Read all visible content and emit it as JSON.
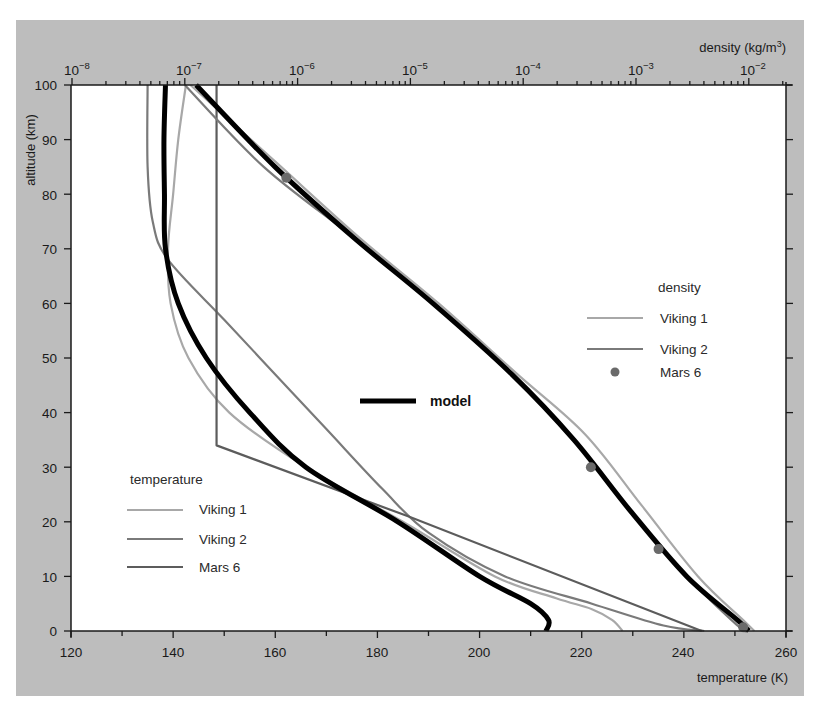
{
  "chart_data": {
    "type": "line",
    "title": "",
    "ylabel": "altitude (km)",
    "xlabel": "temperature (K)",
    "x2label": "density (kg/m3)",
    "ylim": [
      0,
      100
    ],
    "xlim": [
      120,
      260
    ],
    "x2lim_log10": [
      -8,
      -1.67
    ],
    "grid": false,
    "y_ticks": [
      "0",
      "10",
      "20",
      "30",
      "40",
      "50",
      "60",
      "70",
      "80",
      "90",
      "100"
    ],
    "x_ticks": [
      "120",
      "140",
      "160",
      "180",
      "200",
      "220",
      "240",
      "260"
    ],
    "x2_ticks": [
      "10⁻⁸",
      "10⁻⁷",
      "10⁻⁶",
      "10⁻⁵",
      "10⁻⁴",
      "10⁻³",
      "10⁻²"
    ],
    "series": [
      {
        "name": "model (temperature)",
        "group": "temperature",
        "style": "thick-black",
        "points": [
          [
            138.5,
            100
          ],
          [
            138.2,
            90
          ],
          [
            138.3,
            80
          ],
          [
            138.5,
            70
          ],
          [
            141,
            60
          ],
          [
            146.5,
            50
          ],
          [
            155,
            40
          ],
          [
            166,
            30
          ],
          [
            184,
            20
          ],
          [
            200,
            10
          ],
          [
            210,
            5
          ],
          [
            213.5,
            2
          ],
          [
            213,
            0
          ]
        ]
      },
      {
        "name": "Viking 1 (temperature)",
        "group": "temperature",
        "style": "light-gray",
        "points": [
          [
            142.5,
            100
          ],
          [
            141,
            90
          ],
          [
            140,
            80
          ],
          [
            139,
            70
          ],
          [
            139.5,
            60
          ],
          [
            143,
            50
          ],
          [
            151,
            40
          ],
          [
            166,
            30
          ],
          [
            185,
            20
          ],
          [
            203,
            10
          ],
          [
            215,
            6
          ],
          [
            222,
            4
          ],
          [
            226,
            2
          ],
          [
            228,
            0
          ]
        ]
      },
      {
        "name": "Viking 2 (temperature)",
        "group": "temperature",
        "style": "medium-gray",
        "points": [
          [
            135,
            100
          ],
          [
            135,
            85
          ],
          [
            136,
            75
          ],
          [
            139,
            68
          ],
          [
            150,
            57
          ],
          [
            160,
            47
          ],
          [
            170,
            37
          ],
          [
            181,
            26
          ],
          [
            190,
            18
          ],
          [
            205,
            10
          ],
          [
            222,
            5
          ],
          [
            236,
            1
          ],
          [
            244,
            0
          ]
        ]
      },
      {
        "name": "Mars 6 (temperature)",
        "group": "temperature",
        "style": "dark-gray",
        "points": [
          [
            148.5,
            100
          ],
          [
            148.5,
            34
          ],
          [
            186,
            21
          ],
          [
            243.5,
            0
          ]
        ]
      }
    ],
    "density_series": [
      {
        "name": "model (density)",
        "style": "thick-black",
        "points_log10": [
          [
            -6.9,
            100
          ],
          [
            -6.2,
            85
          ],
          [
            -5.5,
            72
          ],
          [
            -4.8,
            60
          ],
          [
            -4.1,
            47
          ],
          [
            -3.55,
            35
          ],
          [
            -3.05,
            22
          ],
          [
            -2.55,
            10
          ],
          [
            -2.1,
            2
          ],
          [
            -2.0,
            0
          ]
        ]
      },
      {
        "name": "Viking 1 (density)",
        "style": "light-gray",
        "points_log10": [
          [
            -6.95,
            100
          ],
          [
            -6.2,
            86
          ],
          [
            -5.45,
            72
          ],
          [
            -4.75,
            60
          ],
          [
            -4.05,
            47
          ],
          [
            -3.45,
            36
          ],
          [
            -2.95,
            23
          ],
          [
            -2.45,
            10
          ],
          [
            -2.05,
            2
          ],
          [
            -1.95,
            0
          ]
        ]
      },
      {
        "name": "Viking 2 (density)",
        "style": "medium-gray",
        "points_log10": [
          [
            -7.0,
            100
          ],
          [
            -6.3,
            85
          ],
          [
            -5.5,
            72
          ],
          [
            -4.8,
            60
          ],
          [
            -4.1,
            47
          ],
          [
            -3.55,
            35
          ],
          [
            -3.05,
            22
          ],
          [
            -2.55,
            10
          ],
          [
            -2.1,
            1
          ],
          [
            -2.02,
            0
          ]
        ]
      },
      {
        "name": "Mars 6 (density)",
        "style": "dots",
        "points_log10": [
          [
            -6.1,
            83
          ],
          [
            -3.4,
            30
          ],
          [
            -2.8,
            15
          ],
          [
            -2.05,
            0.7
          ]
        ]
      }
    ]
  },
  "axes": {
    "y_title": "altitude (km)",
    "x_title": "temperature (K)",
    "x2_title_prefix": "density (kg/m",
    "x2_title_sup": "3",
    "x2_title_suffix": ")",
    "y_ticks": [
      "0",
      "10",
      "20",
      "30",
      "40",
      "50",
      "60",
      "70",
      "80",
      "90",
      "100"
    ],
    "x_ticks": [
      "120",
      "140",
      "160",
      "180",
      "200",
      "220",
      "240",
      "260"
    ],
    "x2_ticks": [
      {
        "base": "10",
        "exp": "−8"
      },
      {
        "base": "10",
        "exp": "−7"
      },
      {
        "base": "10",
        "exp": "−6"
      },
      {
        "base": "10",
        "exp": "−5"
      },
      {
        "base": "10",
        "exp": "−4"
      },
      {
        "base": "10",
        "exp": "−3"
      },
      {
        "base": "10",
        "exp": "−2"
      }
    ]
  },
  "legends": {
    "density": {
      "title": "density",
      "items": [
        "Viking 1",
        "Viking 2",
        "Mars 6"
      ]
    },
    "temperature": {
      "title": "temperature",
      "items": [
        "Viking 1",
        "Viking 2",
        "Mars 6"
      ]
    },
    "model": {
      "label": "model"
    }
  },
  "colors": {
    "frame": "#bdbdbd",
    "plot_bg": "#ffffff",
    "model": "#000000",
    "viking1": "#a8a8a8",
    "viking2": "#7a7a7a",
    "mars6": "#5c5c5c",
    "mars6_dot": "#6a6a6a"
  }
}
